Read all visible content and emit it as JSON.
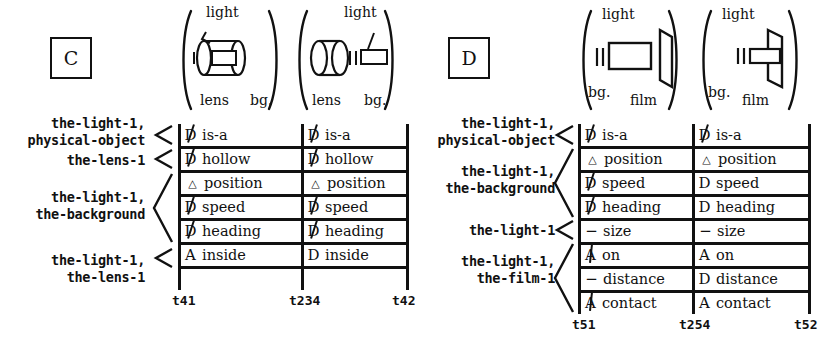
{
  "panels": [
    {
      "id": "C",
      "box_label": "C",
      "pictograms": [
        {
          "id": "c-left",
          "labels": [
            "light",
            "lens",
            "bg."
          ],
          "scene": "light-inside-lens"
        },
        {
          "id": "c-right",
          "labels": [
            "light",
            "lens",
            "bg."
          ],
          "scene": "light-outside-lens"
        }
      ],
      "row_labels": [
        {
          "text": "the-light-1,\nphysical-object",
          "spans": 1
        },
        {
          "text": "the-lens-1",
          "spans": 1
        },
        {
          "text": "the-light-1,\nthe-background",
          "spans": 3
        },
        {
          "text": "the-light-1,\nthe-lens-1",
          "spans": 1
        }
      ],
      "rows": [
        {
          "left": {
            "symbol": "D",
            "struck": true,
            "text": "is-a"
          },
          "right": {
            "symbol": "D",
            "struck": true,
            "text": "is-a"
          }
        },
        {
          "left": {
            "symbol": "D",
            "struck": true,
            "text": "hollow"
          },
          "right": {
            "symbol": "D",
            "struck": true,
            "text": "hollow"
          }
        },
        {
          "left": {
            "symbol": "△",
            "struck": false,
            "text": "position"
          },
          "right": {
            "symbol": "△",
            "struck": false,
            "text": "position"
          }
        },
        {
          "left": {
            "symbol": "D",
            "struck": true,
            "text": "speed"
          },
          "right": {
            "symbol": "D",
            "struck": true,
            "text": "speed"
          }
        },
        {
          "left": {
            "symbol": "D",
            "struck": true,
            "text": "heading"
          },
          "right": {
            "symbol": "D",
            "struck": true,
            "text": "heading"
          }
        },
        {
          "left": {
            "symbol": "A",
            "struck": false,
            "text": "inside"
          },
          "right": {
            "symbol": "D",
            "struck": false,
            "text": "inside"
          }
        }
      ],
      "ticks": [
        "t41",
        "t234",
        "t42"
      ]
    },
    {
      "id": "D",
      "box_label": "D",
      "pictograms": [
        {
          "id": "d-left",
          "labels": [
            "light",
            "bg.",
            "film"
          ],
          "scene": "light-away-from-film"
        },
        {
          "id": "d-right",
          "labels": [
            "light",
            "bg.",
            "film"
          ],
          "scene": "light-contacting-film"
        }
      ],
      "row_labels": [
        {
          "text": "the-light-1,\nphysical-object",
          "spans": 1
        },
        {
          "text": "the-light-1,\nthe-background",
          "spans": 3
        },
        {
          "text": "the-light-1",
          "spans": 1
        },
        {
          "text": "the-light-1,\nthe-film-1",
          "spans": 3
        }
      ],
      "rows": [
        {
          "left": {
            "symbol": "D",
            "struck": true,
            "text": "is-a"
          },
          "right": {
            "symbol": "D",
            "struck": true,
            "text": "is-a"
          }
        },
        {
          "left": {
            "symbol": "△",
            "struck": false,
            "text": "position"
          },
          "right": {
            "symbol": "△",
            "struck": false,
            "text": "position"
          }
        },
        {
          "left": {
            "symbol": "D",
            "struck": true,
            "text": "speed"
          },
          "right": {
            "symbol": "D",
            "struck": false,
            "text": "speed"
          }
        },
        {
          "left": {
            "symbol": "D",
            "struck": true,
            "text": "heading"
          },
          "right": {
            "symbol": "D",
            "struck": false,
            "text": "heading"
          }
        },
        {
          "left": {
            "symbol": "−",
            "struck": false,
            "text": "size"
          },
          "right": {
            "symbol": "−",
            "struck": false,
            "text": "size"
          }
        },
        {
          "left": {
            "symbol": "A",
            "struck": true,
            "text": "on"
          },
          "right": {
            "symbol": "A",
            "struck": false,
            "text": "on"
          }
        },
        {
          "left": {
            "symbol": "−",
            "struck": false,
            "text": "distance"
          },
          "right": {
            "symbol": "D",
            "struck": false,
            "text": "distance"
          }
        },
        {
          "left": {
            "symbol": "A",
            "struck": true,
            "text": "contact"
          },
          "right": {
            "symbol": "A",
            "struck": false,
            "text": "contact"
          }
        }
      ],
      "ticks": [
        "t51",
        "t254",
        "t52"
      ]
    }
  ]
}
